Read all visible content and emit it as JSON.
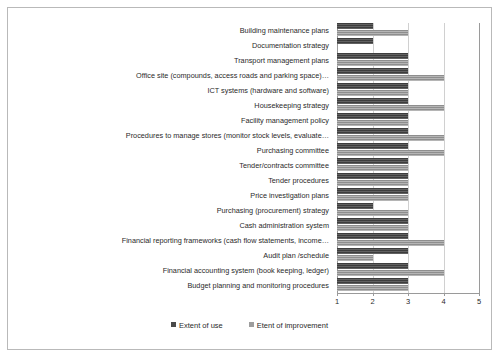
{
  "chart_data": {
    "type": "bar",
    "orientation": "horizontal",
    "title": "",
    "xlabel": "",
    "ylabel": "",
    "xlim": [
      1,
      5
    ],
    "xticks": [
      1,
      2,
      3,
      4,
      5
    ],
    "grid": true,
    "legend_position": "bottom",
    "categories": [
      "Building maintenance plans",
      "Documentation strategy",
      "Transport management plans",
      "Office site (compounds, access roads and parking space)…",
      "ICT systems (hardware and software)",
      "Housekeeping strategy",
      "Facility management policy",
      "Procedures to manage stores (monitor stock levels, evaluate…",
      "Purchasing committee",
      "Tender/contracts committee",
      "Tender procedures",
      "Price investigation plans",
      "Purchasing (procurement) strategy",
      "Cash administration system",
      "Financial reporting frameworks (cash flow statements, income…",
      "Audit plan /schedule",
      "Financial accounting system (book keeping, ledger)",
      "Budget planning and monitoring procedures"
    ],
    "series": [
      {
        "name": "Extent of use",
        "color": "#4a4a4a",
        "values": [
          2,
          2,
          3,
          3,
          3,
          3,
          3,
          3,
          3,
          3,
          3,
          3,
          2,
          3,
          3,
          3,
          3,
          3
        ]
      },
      {
        "name": "Etent of improvement",
        "color": "#9d9d9d",
        "values": [
          3,
          1,
          3,
          4,
          3,
          4,
          3,
          4,
          4,
          3,
          3,
          3,
          3,
          3,
          4,
          2,
          4,
          3
        ]
      }
    ]
  },
  "axis": {
    "tick_labels": [
      "1",
      "2",
      "3",
      "4",
      "5"
    ]
  },
  "legend": {
    "items": [
      {
        "label": "Extent of use"
      },
      {
        "label": "Etent of improvement"
      }
    ]
  }
}
